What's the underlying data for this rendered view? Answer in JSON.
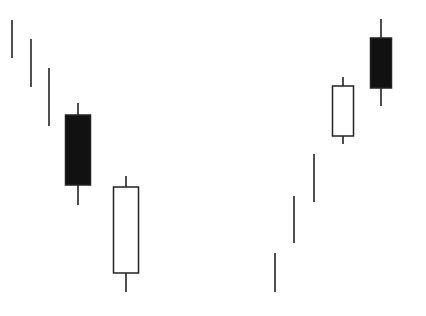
{
  "chart_data": {
    "type": "candlestick",
    "title": "",
    "xlabel": "",
    "ylabel": "",
    "grid": false,
    "legend": null,
    "note": "Illustrative candlestick pattern diagram with no axes; values are pixel-space y coordinates (smaller = higher price). Left group: downtrend bars then black candle and white candle. Right group: uptrend bars then white candle and black candle.",
    "colors": {
      "bearish": "#111111",
      "bullish": "#ffffff",
      "outline": "#222222",
      "background": "#ffffff"
    },
    "series": [
      {
        "name": "left-group",
        "bars": [
          {
            "type": "line",
            "x": 12,
            "high": 20,
            "low": 58
          },
          {
            "type": "line",
            "x": 31,
            "high": 39,
            "low": 87
          },
          {
            "type": "line",
            "x": 49,
            "high": 68,
            "low": 126
          },
          {
            "type": "candle",
            "color": "black",
            "x": 78,
            "width": 25,
            "high": 103,
            "open": 115,
            "close": 185,
            "low": 205
          },
          {
            "type": "candle",
            "color": "white",
            "x": 126,
            "width": 25,
            "high": 176,
            "open": 273,
            "close": 187,
            "low": 292
          }
        ]
      },
      {
        "name": "right-group",
        "bars": [
          {
            "type": "line",
            "x": 275,
            "high": 253,
            "low": 292
          },
          {
            "type": "line",
            "x": 294,
            "high": 196,
            "low": 243
          },
          {
            "type": "line",
            "x": 314,
            "high": 154,
            "low": 202
          },
          {
            "type": "candle",
            "color": "white",
            "x": 343,
            "width": 21,
            "high": 77,
            "open": 136,
            "close": 86,
            "low": 144
          },
          {
            "type": "candle",
            "color": "black",
            "x": 381,
            "width": 21,
            "high": 19,
            "open": 38,
            "close": 88,
            "low": 106
          }
        ]
      }
    ]
  },
  "caption": ""
}
